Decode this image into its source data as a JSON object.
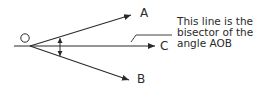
{
  "diagram": {
    "labels": {
      "vertex": "O",
      "ray_a": "A",
      "ray_b": "B",
      "ray_c": "C"
    },
    "callout": {
      "lines": [
        "This line is the",
        "bisector of the",
        "angle AOB"
      ]
    },
    "colors": {
      "stroke": "#2a2a2a",
      "text": "#2a2a2a",
      "background": "#ffffff"
    }
  }
}
